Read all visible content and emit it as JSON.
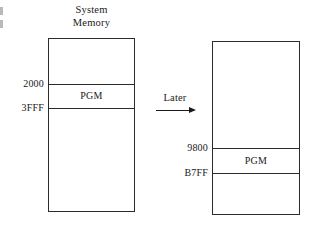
{
  "figure": {
    "title_line1": "System",
    "title_line2": "Memory",
    "transition_label": "Later"
  },
  "before": {
    "program_label": "PGM",
    "start_address": "2000",
    "end_address": "3FFF"
  },
  "after": {
    "program_label": "PGM",
    "start_address": "9800",
    "end_address": "B7FF"
  }
}
